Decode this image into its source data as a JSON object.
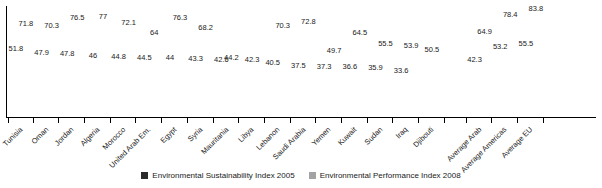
{
  "chart_data": {
    "type": "bar",
    "title": "",
    "xlabel": "",
    "ylabel": "",
    "ylim": [
      0,
      90
    ],
    "grid": false,
    "legend_position": "bottom",
    "categories": [
      "Tunisia",
      "Oman",
      "Jordan",
      "Algeria",
      "Morocco",
      "United Arab Em.",
      "Egypt",
      "Syria",
      "Mauritania",
      "Libya",
      "Lebanon",
      "Saudi Arabia",
      "Yemen",
      "Kuwait",
      "Sudan",
      "Iraq",
      "Djibouti",
      "",
      "Average Arab",
      "Average Americas",
      "Average EU"
    ],
    "series": [
      {
        "name": "Environmental Sustainability Index 2005",
        "color": "#2b2b2b",
        "values": [
          51.8,
          47.9,
          47.8,
          46,
          44.8,
          44.5,
          44,
          43.3,
          42.6,
          42.3,
          40.5,
          37.5,
          37.3,
          36.6,
          35.9,
          33.6,
          null,
          null,
          42.3,
          53.2,
          55.5
        ]
      },
      {
        "name": "Environmental Performance Index 2008",
        "color": "#a3a3a3",
        "values": [
          71.8,
          70.3,
          76.5,
          77,
          72.1,
          64,
          76.3,
          68.2,
          44.2,
          null,
          70.3,
          72.8,
          49.7,
          64.5,
          55.5,
          53.9,
          50.5,
          null,
          64.9,
          78.4,
          83.8
        ]
      }
    ]
  },
  "legend": {
    "items": [
      {
        "label": "Environmental Sustainability Index 2005"
      },
      {
        "label": "Environmental Performance Index 2008"
      }
    ]
  }
}
